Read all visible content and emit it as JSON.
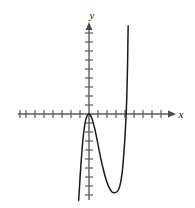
{
  "figure": {
    "title": "",
    "background_color": "#ffffff",
    "axis_color": "#5a5a5a",
    "curve_color": "#1a1a1a",
    "tick_color": "#5a5a5a"
  },
  "axes": {
    "x_label": "x",
    "y_label": "y",
    "x_label_icon": "x-axis-arrow-icon",
    "y_label_icon": "y-axis-arrow-icon",
    "origin_px": {
      "x": 89,
      "y": 114
    },
    "tick_spacing_px": 9,
    "tick_half_length_px": 4,
    "x_ticks_left": 8,
    "x_ticks_right": 8,
    "y_ticks_up": 9,
    "y_ticks_down": 9,
    "x_axis_start_px": 18,
    "x_axis_end_px": 172,
    "y_axis_top_px": 22,
    "y_axis_bottom_px": 200
  },
  "chart_data": {
    "type": "line",
    "title": "",
    "xlabel": "x",
    "ylabel": "y",
    "grid": false,
    "legend": null,
    "xlim": [
      -8,
      9
    ],
    "ylim": [
      -9,
      10
    ],
    "x_tick_interval": 1,
    "y_tick_interval": 1,
    "series": [
      {
        "name": "polynomial curve",
        "description": "Quartic-like polynomial with a local maximum touching the x-axis at the origin, falling steeply on the left and rising steeply on the right after a local minimum.",
        "features": {
          "local_maximum": {
            "x": 0,
            "y": 0
          },
          "local_minimum": {
            "x": 3.2,
            "y": -8.7
          },
          "x_intercepts": [
            0,
            4.1
          ],
          "left_branch_exits_bottom_at_x": -1.1,
          "right_branch_exits_top_at_x": 4.35
        },
        "x": [
          -1.15,
          -1.05,
          -0.95,
          -0.85,
          -0.75,
          -0.65,
          -0.55,
          -0.45,
          -0.35,
          -0.25,
          -0.15,
          -0.05,
          0.0,
          0.1,
          0.25,
          0.45,
          0.7,
          1.0,
          1.3,
          1.6,
          1.9,
          2.2,
          2.5,
          2.8,
          3.0,
          3.2,
          3.4,
          3.6,
          3.75,
          3.9,
          4.0,
          4.1,
          4.2,
          4.28,
          4.35
        ],
        "y": [
          -9.6,
          -8.0,
          -6.4,
          -5.0,
          -3.7,
          -2.6,
          -1.75,
          -1.1,
          -0.6,
          -0.3,
          -0.1,
          -0.02,
          0.0,
          -0.05,
          -0.3,
          -0.9,
          -1.9,
          -3.4,
          -4.9,
          -6.2,
          -7.3,
          -8.1,
          -8.6,
          -8.75,
          -8.7,
          -8.55,
          -8.1,
          -7.1,
          -5.9,
          -4.0,
          -2.5,
          -0.6,
          1.9,
          5.2,
          9.8
        ]
      }
    ]
  }
}
